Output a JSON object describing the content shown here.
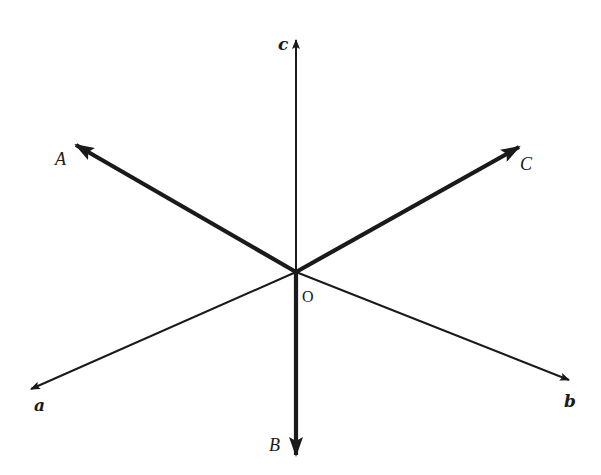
{
  "diagram": {
    "origin": {
      "label": "O",
      "x": 296,
      "y": 272
    },
    "color": "#1a1a1a",
    "background": "#ffffff",
    "vectors": [
      {
        "id": "c",
        "label": "c",
        "style": "bold-italic",
        "weight": "thin",
        "tip": [
          296,
          40
        ],
        "label_pos": [
          278,
          50
        ]
      },
      {
        "id": "a",
        "label": "a",
        "style": "bold-italic",
        "weight": "thin",
        "tip": [
          31,
          389
        ],
        "label_pos": [
          34,
          411
        ]
      },
      {
        "id": "b",
        "label": "b",
        "style": "bold-italic",
        "weight": "thin",
        "tip": [
          569,
          380
        ],
        "label_pos": [
          564,
          407
        ]
      },
      {
        "id": "A",
        "label": "A",
        "style": "italic",
        "weight": "thick",
        "tip": [
          76,
          145
        ],
        "label_pos": [
          55,
          165
        ]
      },
      {
        "id": "C",
        "label": "C",
        "style": "italic",
        "weight": "thick",
        "tip": [
          519,
          147
        ],
        "label_pos": [
          520,
          170
        ]
      },
      {
        "id": "B",
        "label": "B",
        "style": "italic",
        "weight": "thick",
        "tip": [
          296,
          455
        ],
        "label_pos": [
          269,
          451
        ]
      }
    ]
  }
}
